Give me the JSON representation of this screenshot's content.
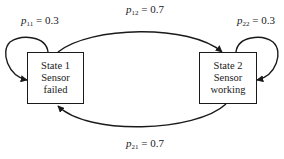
{
  "states": [
    {
      "id": 1,
      "lines": [
        "State 1",
        "Sensor",
        "failed"
      ]
    },
    {
      "id": 2,
      "lines": [
        "State 2",
        "Sensor",
        "working"
      ]
    }
  ],
  "transitions": {
    "p11": {
      "symbol": "p",
      "sub": "11",
      "eq": " = 0.3"
    },
    "p12": {
      "symbol": "p",
      "sub": "12",
      "eq": " = 0.7"
    },
    "p22": {
      "symbol": "p",
      "sub": "22",
      "eq": " = 0.3"
    },
    "p21": {
      "symbol": "p",
      "sub": "21",
      "eq": " = 0.7"
    }
  },
  "colors": {
    "stroke": "#1a1a1a",
    "background": "#ffffff"
  }
}
